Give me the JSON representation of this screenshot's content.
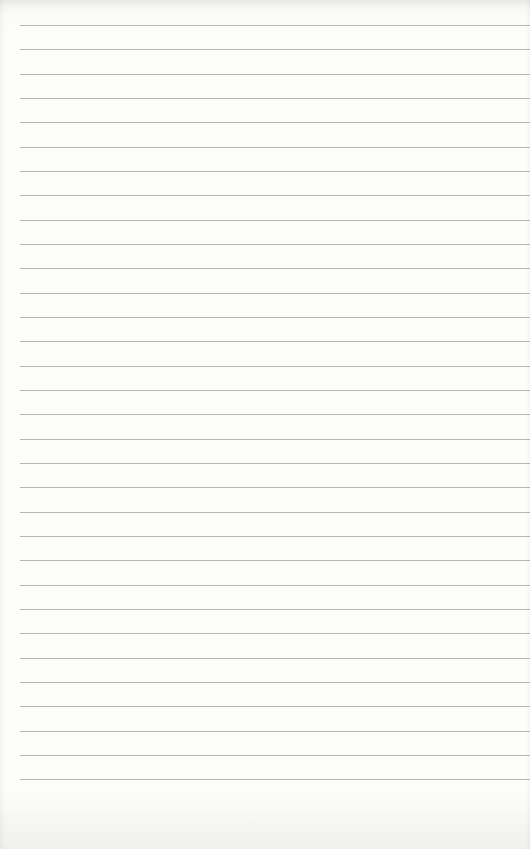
{
  "page": {
    "type": "lined-paper",
    "background_color": "#fdfdfc",
    "line_color": "#a9a9a6",
    "line_count": 32,
    "first_line_y": 25,
    "line_spacing": 24.33,
    "left_margin": 20,
    "text": []
  }
}
